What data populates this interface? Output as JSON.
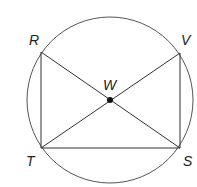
{
  "diagram": {
    "type": "geometry",
    "top_cutoff_text": "",
    "circle": {
      "cx": 110,
      "cy": 100,
      "r": 83,
      "stroke": "#555555"
    },
    "points": {
      "R": {
        "label": "R",
        "x": 41,
        "y": 52,
        "label_x": 29,
        "label_y": 45
      },
      "V": {
        "label": "V",
        "x": 180,
        "y": 53,
        "label_x": 181,
        "label_y": 45
      },
      "T": {
        "label": "T",
        "x": 41,
        "y": 148,
        "label_x": 26,
        "label_y": 166
      },
      "S": {
        "label": "S",
        "x": 180,
        "y": 148,
        "label_x": 183,
        "label_y": 166
      },
      "W": {
        "label": "W",
        "x": 110,
        "y": 100,
        "label_x": 103,
        "label_y": 90
      }
    },
    "segments": [
      "RT",
      "VS",
      "TS",
      "RS",
      "VT"
    ],
    "line_color": "#333333"
  }
}
